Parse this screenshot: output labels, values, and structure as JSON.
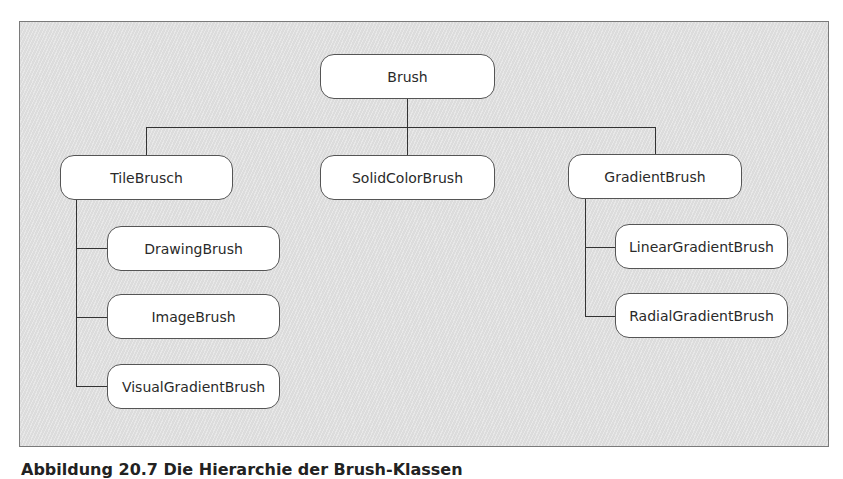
{
  "diagram": {
    "type": "class-hierarchy",
    "root": {
      "label": "Brush"
    },
    "level1": [
      {
        "label": "TileBrusch"
      },
      {
        "label": "SolidColorBrush"
      },
      {
        "label": "GradientBrush"
      }
    ],
    "tile_children": [
      {
        "label": "DrawingBrush"
      },
      {
        "label": "ImageBrush"
      },
      {
        "label": "VisualGradientBrush"
      }
    ],
    "gradient_children": [
      {
        "label": "LinearGradientBrush"
      },
      {
        "label": "RadialGradientBrush"
      }
    ],
    "edges": [
      [
        "Brush",
        "TileBrusch"
      ],
      [
        "Brush",
        "SolidColorBrush"
      ],
      [
        "Brush",
        "GradientBrush"
      ],
      [
        "TileBrusch",
        "DrawingBrush"
      ],
      [
        "TileBrusch",
        "ImageBrush"
      ],
      [
        "TileBrusch",
        "VisualGradientBrush"
      ],
      [
        "GradientBrush",
        "LinearGradientBrush"
      ],
      [
        "GradientBrush",
        "RadialGradientBrush"
      ]
    ]
  },
  "caption": "Abbildung 20.7  Die Hierarchie der Brush-Klassen"
}
